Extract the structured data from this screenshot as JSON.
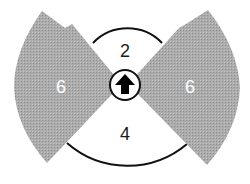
{
  "diagram": {
    "type": "firing-arc",
    "colors": {
      "sector_fill": "#a9a9a9",
      "sector_texture": "#8f8f8f",
      "arc_stroke": "#111111",
      "label_dark": "#1a1a1a",
      "label_light": "#ffffff",
      "center_fill": "#ffffff",
      "arrow_fill": "#000000"
    },
    "sectors": [
      {
        "id": "left",
        "label": "6",
        "shaded": true
      },
      {
        "id": "right",
        "label": "6",
        "shaded": true
      },
      {
        "id": "front",
        "label": "2",
        "shaded": false
      },
      {
        "id": "rear",
        "label": "4",
        "shaded": false
      }
    ],
    "center": {
      "icon": "arrow-up-icon",
      "meaning": "facing direction"
    }
  }
}
